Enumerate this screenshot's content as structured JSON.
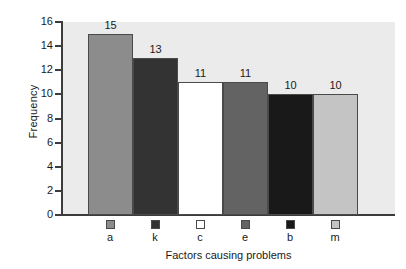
{
  "chart_data": {
    "type": "bar",
    "title": "",
    "xlabel": "Factors causing problems",
    "ylabel": "Frequency",
    "categories": [
      "a",
      "k",
      "c",
      "e",
      "b",
      "m"
    ],
    "values": [
      15,
      13,
      11,
      11,
      10,
      10
    ],
    "value_labels": [
      "15",
      "13",
      "11",
      "11",
      "10",
      "10"
    ],
    "bar_colors": [
      "#8c8c8c",
      "#333333",
      "#ffffff",
      "#636363",
      "#191919",
      "#c4c4c4"
    ],
    "ylim": [
      0,
      16
    ],
    "ytick_labels": [
      "0",
      "2",
      "4",
      "6",
      "8",
      "10",
      "12",
      "14",
      "16"
    ],
    "ytick_values": [
      0,
      2,
      4,
      6,
      8,
      10,
      12,
      14,
      16
    ],
    "grid": false,
    "legend_position": "below-axis",
    "legend_entries": [
      {
        "label": "a",
        "color": "#8c8c8c"
      },
      {
        "label": "k",
        "color": "#333333"
      },
      {
        "label": "c",
        "color": "#ffffff"
      },
      {
        "label": "e",
        "color": "#636363"
      },
      {
        "label": "b",
        "color": "#191919"
      },
      {
        "label": "m",
        "color": "#c4c4c4"
      }
    ],
    "plot_background": "#ebebeb",
    "page_background": "#ffffff",
    "axis_color": "#3c3c3c"
  }
}
